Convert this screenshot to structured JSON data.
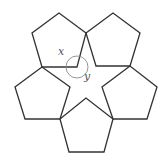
{
  "diagram": {
    "type": "geometry",
    "shape_count": 5,
    "shape": "regular pentagon",
    "pentagons": [
      {
        "id": "top-left"
      },
      {
        "id": "top-right"
      },
      {
        "id": "left"
      },
      {
        "id": "right"
      },
      {
        "id": "bottom"
      }
    ],
    "angle_labels": [
      {
        "id": "x",
        "text": "x"
      },
      {
        "id": "y",
        "text": "y"
      }
    ],
    "colors": {
      "stroke": "#333333",
      "arc": "#8a8a8a",
      "label": "#555555",
      "background": "#ffffff"
    }
  }
}
